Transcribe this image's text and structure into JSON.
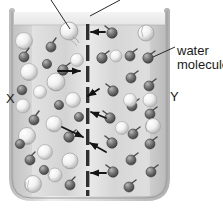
{
  "diagram": {
    "container": {
      "name": "beaker",
      "fill_color": "#dcdcdc",
      "wall_color": "#b8b8b8",
      "surface_band_color": "#efefef"
    },
    "membrane": {
      "name": "semipermeable-membrane",
      "color": "#3a3a3a",
      "orientation": "vertical",
      "segments": 8
    },
    "regions": [
      {
        "id": "X",
        "label": "X",
        "side": "left",
        "description": "solution side with large solute particles"
      },
      {
        "id": "Y",
        "label": "Y",
        "side": "right",
        "description": "water side"
      }
    ],
    "callouts": [
      {
        "id": "water-molecule",
        "label": "water\nmolecule",
        "label_line1": "water",
        "label_line2": "molecule",
        "points_to": "small dark particle on right side"
      },
      {
        "id": "leader-left",
        "label": "",
        "points_to": "large light particle in region X"
      },
      {
        "id": "leader-right",
        "label": "",
        "points_to": "membrane"
      }
    ],
    "particles": {
      "solute": {
        "name": "solute-particle",
        "color": "#f2f2f2",
        "edge": "#9a9a9a",
        "count_left": 14,
        "count_right": 6
      },
      "water": {
        "name": "water-molecule-particle",
        "color": "#6e6e6e",
        "edge": "#3d3d3d",
        "count_left": 13,
        "count_right": 17
      }
    },
    "arrows": {
      "name": "water-flow-arrow",
      "color": "#1a1a1a",
      "count": 6,
      "direction_note": "water molecules move through membrane pores in both directions"
    },
    "colors": {
      "ink": "#1a1a1a",
      "beaker_fill": "#dcdcdc",
      "beaker_wall": "#b8b8b8",
      "membrane": "#3a3a3a"
    }
  }
}
